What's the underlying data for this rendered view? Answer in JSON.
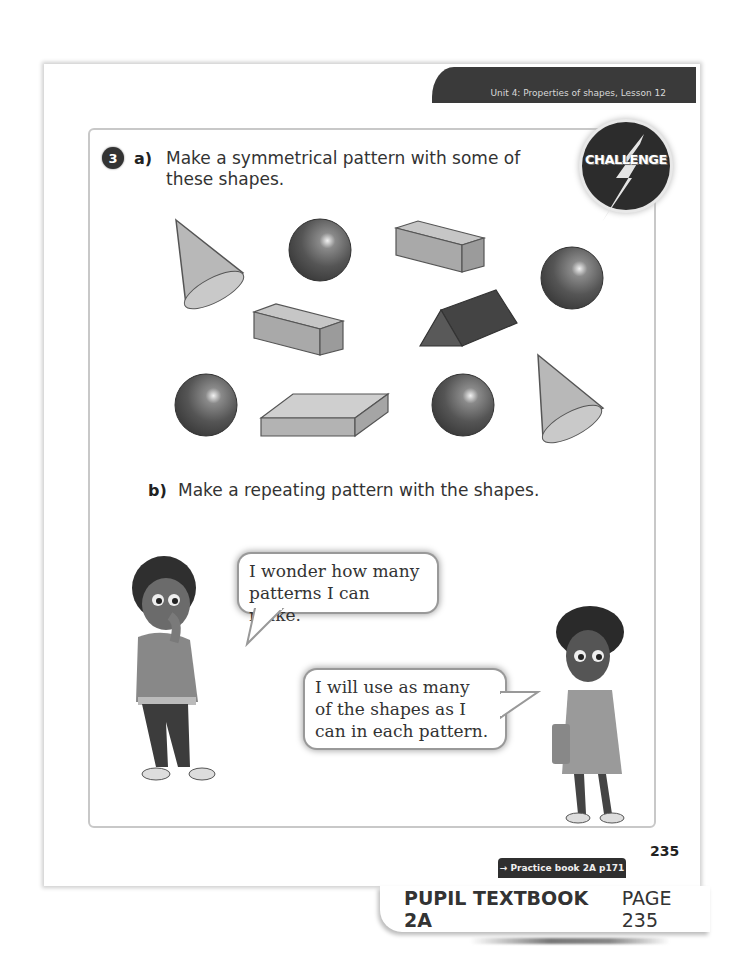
{
  "header": {
    "unit_label": "Unit 4: Properties of shapes, Lesson 12"
  },
  "badge": {
    "label": "CHALLENGE",
    "icon": "lightning-bolt-icon"
  },
  "question": {
    "number": "3",
    "part_a": {
      "label": "a)",
      "line1": "Make a symmetrical pattern with some of",
      "line2": "these shapes."
    },
    "part_b": {
      "label": "b)",
      "text": "Make a repeating pattern with the shapes."
    }
  },
  "shapes": [
    {
      "type": "cone",
      "row": 1
    },
    {
      "type": "sphere",
      "row": 1
    },
    {
      "type": "cuboid",
      "row": 1
    },
    {
      "type": "sphere",
      "row": 1
    },
    {
      "type": "cuboid",
      "row": 2
    },
    {
      "type": "triangular-prism",
      "row": 2
    },
    {
      "type": "sphere",
      "row": 3
    },
    {
      "type": "flat-cuboid",
      "row": 3
    },
    {
      "type": "sphere",
      "row": 3
    },
    {
      "type": "cone",
      "row": 3
    }
  ],
  "speech": {
    "boy": {
      "line1": "I wonder how many",
      "line2": "patterns I can make."
    },
    "girl": {
      "line1": "I will use as many",
      "line2": "of the shapes as I",
      "line3": "can in each pattern."
    }
  },
  "footer": {
    "page_number": "235",
    "practice_link": "→ Practice book 2A p171",
    "book_title": "PUPIL TEXTBOOK 2A",
    "page_label": "PAGE 235"
  },
  "colors": {
    "banner": "#3a3a3a",
    "frame_border": "#c8c8c8",
    "text": "#333333"
  }
}
